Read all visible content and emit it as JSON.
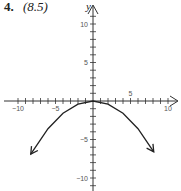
{
  "problem": {
    "number": "4.",
    "reference": "(8.5)"
  },
  "chart_data": {
    "type": "line",
    "title": "",
    "xlabel": "",
    "ylabel": "y",
    "xlim": [
      -10.5,
      11
    ],
    "ylim": [
      -11,
      12
    ],
    "x_ticks": [
      -10,
      -5,
      5,
      10
    ],
    "y_ticks": [
      10,
      5,
      -5,
      -10
    ],
    "grid": false,
    "series": [
      {
        "name": "parabola opening downward, vertex at origin",
        "x": [
          -8.3,
          -6,
          -4,
          -2,
          0,
          2,
          4,
          6,
          8.1
        ],
        "y": [
          -6.9,
          -3.6,
          -1.6,
          -0.4,
          0,
          -0.4,
          -1.6,
          -3.6,
          -6.6
        ],
        "arrows_at_ends": true
      }
    ]
  }
}
